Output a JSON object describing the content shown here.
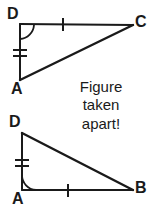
{
  "figure": {
    "background_color": "#ffffff",
    "stroke_color": "#1a1a1a",
    "annotation": {
      "line1": "Figure",
      "line2": "taken",
      "line3": "apart!"
    },
    "triangles": [
      {
        "id": "upper-triangle",
        "name": "triangle-DAC",
        "vertices": [
          {
            "label": "D",
            "x": 20,
            "y": 24,
            "label_x": 7,
            "label_y": 6
          },
          {
            "label": "C",
            "x": 133,
            "y": 25,
            "label_x": 135,
            "label_y": 14
          },
          {
            "label": "A",
            "x": 20,
            "y": 80,
            "label_x": 11,
            "label_y": 81
          }
        ],
        "right_angle_at": "D",
        "marks": [
          {
            "segment": "DC",
            "ticks": 1
          },
          {
            "segment": "DA",
            "ticks": 2
          }
        ]
      },
      {
        "id": "lower-triangle",
        "name": "triangle-DAB",
        "vertices": [
          {
            "label": "D",
            "x": 22,
            "y": 133,
            "label_x": 9,
            "label_y": 114
          },
          {
            "label": "A",
            "x": 22,
            "y": 190,
            "label_x": 12,
            "label_y": 191
          },
          {
            "label": "B",
            "x": 133,
            "y": 190,
            "label_x": 135,
            "label_y": 180
          }
        ],
        "right_angle_at": "A",
        "marks": [
          {
            "segment": "DA",
            "ticks": 2
          },
          {
            "segment": "AB",
            "ticks": 1
          }
        ]
      }
    ]
  }
}
